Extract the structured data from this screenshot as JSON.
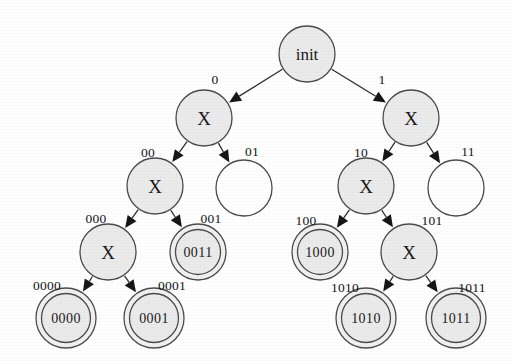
{
  "diagram": {
    "type": "tree",
    "colors": {
      "node_fill": "#ebebeb",
      "node_empty_fill": "#ffffff",
      "stroke": "#4c4c4c",
      "edge": "#2b2b2b",
      "text": "#1a1a1a",
      "background": "#ffffff"
    },
    "nodes": [
      {
        "id": "root",
        "label": "init",
        "shape": "single",
        "filled": true,
        "cx": 307,
        "cy": 54,
        "r": 28
      },
      {
        "id": "n0",
        "label": "X",
        "shape": "single",
        "filled": true,
        "cx": 204,
        "cy": 118,
        "r": 28
      },
      {
        "id": "n1",
        "label": "X",
        "shape": "single",
        "filled": true,
        "cx": 411,
        "cy": 118,
        "r": 28
      },
      {
        "id": "n00",
        "label": "X",
        "shape": "single",
        "filled": true,
        "cx": 155,
        "cy": 186,
        "r": 28
      },
      {
        "id": "n01",
        "label": "",
        "shape": "single",
        "filled": false,
        "cx": 244,
        "cy": 188,
        "r": 28
      },
      {
        "id": "n10",
        "label": "X",
        "shape": "single",
        "filled": true,
        "cx": 366,
        "cy": 186,
        "r": 28
      },
      {
        "id": "n11",
        "label": "",
        "shape": "single",
        "filled": false,
        "cx": 456,
        "cy": 188,
        "r": 28
      },
      {
        "id": "n000",
        "label": "X",
        "shape": "single",
        "filled": true,
        "cx": 108,
        "cy": 252,
        "r": 28
      },
      {
        "id": "n0011",
        "label": "0011",
        "shape": "double",
        "filled": true,
        "cx": 198,
        "cy": 252,
        "r": 28
      },
      {
        "id": "n1000",
        "label": "1000",
        "shape": "double",
        "filled": true,
        "cx": 320,
        "cy": 252,
        "r": 28
      },
      {
        "id": "n101",
        "label": "X",
        "shape": "single",
        "filled": true,
        "cx": 409,
        "cy": 252,
        "r": 28
      },
      {
        "id": "n0000",
        "label": "0000",
        "shape": "double",
        "filled": true,
        "cx": 66,
        "cy": 318,
        "r": 30
      },
      {
        "id": "n0001",
        "label": "0001",
        "shape": "double",
        "filled": true,
        "cx": 154,
        "cy": 318,
        "r": 30
      },
      {
        "id": "n1010",
        "label": "1010",
        "shape": "double",
        "filled": true,
        "cx": 366,
        "cy": 318,
        "r": 30
      },
      {
        "id": "n1011",
        "label": "1011",
        "shape": "double",
        "filled": true,
        "cx": 456,
        "cy": 318,
        "r": 30
      }
    ],
    "edges": [
      {
        "from": "root",
        "to": "n0",
        "label": "0",
        "label_x": 215,
        "label_y": 79
      },
      {
        "from": "root",
        "to": "n1",
        "label": "1",
        "label_x": 382,
        "label_y": 79
      },
      {
        "from": "n0",
        "to": "n00",
        "label": "00",
        "label_x": 148,
        "label_y": 152
      },
      {
        "from": "n0",
        "to": "n01",
        "label": "01",
        "label_x": 252,
        "label_y": 151
      },
      {
        "from": "n1",
        "to": "n10",
        "label": "10",
        "label_x": 361,
        "label_y": 152
      },
      {
        "from": "n1",
        "to": "n11",
        "label": "11",
        "label_x": 468,
        "label_y": 151
      },
      {
        "from": "n00",
        "to": "n000",
        "label": "000",
        "label_x": 96,
        "label_y": 218
      },
      {
        "from": "n00",
        "to": "n0011",
        "label": "001",
        "label_x": 211,
        "label_y": 218
      },
      {
        "from": "n10",
        "to": "n1000",
        "label": "100",
        "label_x": 306,
        "label_y": 220
      },
      {
        "from": "n10",
        "to": "n101",
        "label": "101",
        "label_x": 432,
        "label_y": 220
      },
      {
        "from": "n000",
        "to": "n0000",
        "label": "0000",
        "label_x": 47,
        "label_y": 285
      },
      {
        "from": "n000",
        "to": "n0001",
        "label": "0001",
        "label_x": 172,
        "label_y": 285
      },
      {
        "from": "n101",
        "to": "n1010",
        "label": "1010",
        "label_x": 345,
        "label_y": 287
      },
      {
        "from": "n101",
        "to": "n1011",
        "label": "1011",
        "label_x": 472,
        "label_y": 287
      }
    ]
  }
}
